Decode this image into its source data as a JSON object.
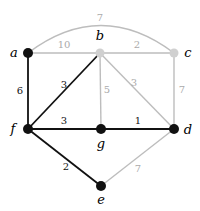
{
  "diagram": {
    "type": "weighted-graph",
    "colors": {
      "highlight": "#111111",
      "muted": "#bdbdbd",
      "muted_label": "#aaaaaa",
      "highlight_label": "#111111"
    },
    "nodes": [
      {
        "id": "a",
        "label": "a",
        "highlighted": true
      },
      {
        "id": "b",
        "label": "b",
        "highlighted": false
      },
      {
        "id": "c",
        "label": "c",
        "highlighted": false
      },
      {
        "id": "d",
        "label": "d",
        "highlighted": true
      },
      {
        "id": "e",
        "label": "e",
        "highlighted": true
      },
      {
        "id": "f",
        "label": "f",
        "highlighted": true
      },
      {
        "id": "g",
        "label": "g",
        "highlighted": true
      }
    ],
    "edges": [
      {
        "from": "a",
        "to": "c",
        "weight": "7",
        "highlighted": false,
        "curved": true
      },
      {
        "from": "a",
        "to": "b",
        "weight": "10",
        "highlighted": false
      },
      {
        "from": "b",
        "to": "c",
        "weight": "2",
        "highlighted": false
      },
      {
        "from": "a",
        "to": "f",
        "weight": "6",
        "highlighted": true
      },
      {
        "from": "b",
        "to": "f",
        "weight": "3",
        "highlighted": true
      },
      {
        "from": "b",
        "to": "g",
        "weight": "5",
        "highlighted": false
      },
      {
        "from": "b",
        "to": "d",
        "weight": "3",
        "highlighted": false
      },
      {
        "from": "c",
        "to": "d",
        "weight": "7",
        "highlighted": false
      },
      {
        "from": "f",
        "to": "g",
        "weight": "3",
        "highlighted": true
      },
      {
        "from": "g",
        "to": "d",
        "weight": "1",
        "highlighted": true
      },
      {
        "from": "f",
        "to": "e",
        "weight": "2",
        "highlighted": true
      },
      {
        "from": "d",
        "to": "e",
        "weight": "7",
        "highlighted": false
      }
    ]
  }
}
